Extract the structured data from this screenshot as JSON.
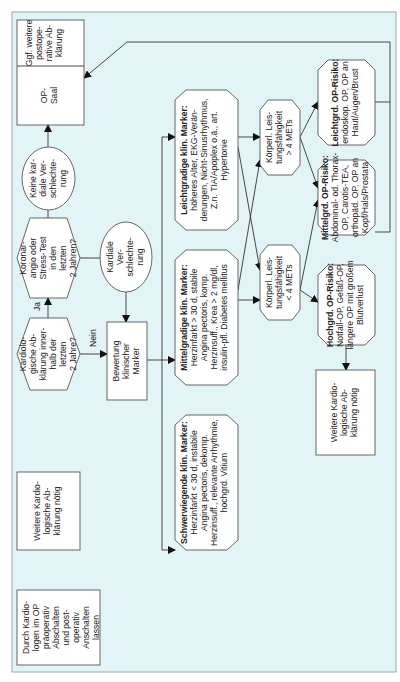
{
  "diagram": {
    "orientation": "rotated-90-ccw",
    "colors": {
      "panel_bg": "#e3f4f7",
      "node_fill": "#ffffff",
      "stroke": "#555555"
    },
    "nodes": {
      "durch_kardiologen": {
        "shape": "rect",
        "lines": [
          "Durch Kardio-",
          "logen im OP",
          "präoperativ",
          "Abschalten",
          "und post-",
          "operativ",
          "Anschalten",
          "lassen"
        ]
      },
      "weitere_links": {
        "shape": "rect",
        "lines": [
          "Weitere Kardio-",
          "logische Ab-",
          "klärung nötig"
        ]
      },
      "kardiologische_abklaerung": {
        "shape": "hexagon",
        "lines": [
          "Kardiolo-",
          "gische Ab-",
          "klärung inner-",
          "halb der",
          "letzten",
          "2 Jahre?"
        ]
      },
      "koronarangio": {
        "shape": "hexagon",
        "lines": [
          "Koronar-",
          "angio oder",
          "Stress-Test",
          "in den",
          "letzten",
          "2 Jahren?"
        ]
      },
      "keine_kardiale": {
        "shape": "ellipse",
        "lines": [
          "Keine kar-",
          "diale Ver-",
          "schlechte-",
          "rung"
        ]
      },
      "kardiale_verschlechterung": {
        "shape": "ellipse",
        "lines": [
          "Kardiale",
          "Ver-",
          "schlechte-",
          "rung"
        ]
      },
      "op_saal": {
        "shape": "rect",
        "lines": [
          "OP-",
          "Saal"
        ]
      },
      "ggf_weitere": {
        "shape": "rect",
        "lines": [
          "Ggf. weitere",
          "postope-",
          "rative Ab-",
          "klärung"
        ]
      },
      "bewertung": {
        "shape": "rect",
        "lines": [
          "Bewertung",
          "klinischer",
          "Marker"
        ]
      },
      "leichtgradige": {
        "shape": "hexagon",
        "title": "Leichtgradige klin. Marker:",
        "lines": [
          "höheres Alter, EKG-Verän-",
          "derungen, Nicht-Sinusrhythmus,",
          "Z.n. TIA/Apoplex o.ä., art.",
          "Hypertonie"
        ]
      },
      "mittelgradige": {
        "shape": "hexagon",
        "title": "Mittelgradige klin. Marker:",
        "lines": [
          "Herzinfarkt > 30 d, stabile",
          "Angina pectoris, komp.",
          "Herzinsuff., Krea > 2 mg/dl,",
          "insulin-pfl. Diabetes mellitus"
        ]
      },
      "schwerwiegende": {
        "shape": "hexagon",
        "title": "Schwerwiegende klin. Marker:",
        "lines": [
          "Herzinfarkt < 30 d, instabile",
          "Angina pectoris, dekomp.",
          "Herzinsuff., relevante Arrhythmie,",
          "hochgrd. Vitium"
        ]
      },
      "leistung_gt4": {
        "shape": "hexagon",
        "lines": [
          "Körperl. Leis-",
          "tungsfähigkeit",
          "> 4 METs"
        ]
      },
      "leistung_lt4": {
        "shape": "hexagon",
        "lines": [
          "Körperl. Leis-",
          "tungsfähigkeit",
          "< 4 METs"
        ]
      },
      "leichtgrd_op": {
        "shape": "hexagon",
        "title": "Leichtgrd. OP-Risiko:",
        "lines": [
          "endoskop. OP, OP an",
          "Haut/Augen/Brust"
        ]
      },
      "mittelgrd_op": {
        "shape": "hexagon",
        "title": "Mittelgrd. OP-Risiko:",
        "lines": [
          "Abdominal- od. Thorax-",
          "OP, Carotis-TEA,",
          "orthopäd. OP, OP an",
          "Kopf/Hals/Prostata"
        ]
      },
      "hochgrd_op": {
        "shape": "hexagon",
        "title": "Hochgrd. OP-Risiko:",
        "lines": [
          "Notfall-OP, Gefäß-OP,",
          "längere OP mit großem",
          "Blutverlust"
        ]
      },
      "weitere_rechts": {
        "shape": "rect",
        "lines": [
          "Weitere Kardio-",
          "logische Ab-",
          "klärung nötig"
        ]
      }
    },
    "edge_labels": {
      "ja": "Ja",
      "nein": "Nein"
    },
    "edges": [
      [
        "kardiologische_abklaerung",
        "koronarangio",
        "Ja"
      ],
      [
        "kardiologische_abklaerung",
        "bewertung",
        "Nein"
      ],
      [
        "koronarangio",
        "keine_kardiale",
        ""
      ],
      [
        "koronarangio",
        "kardiale_verschlechterung",
        ""
      ],
      [
        "keine_kardiale",
        "op_saal",
        ""
      ],
      [
        "kardiale_verschlechterung",
        "bewertung",
        ""
      ],
      [
        "bewertung",
        "leichtgradige",
        ""
      ],
      [
        "bewertung",
        "mittelgradige",
        ""
      ],
      [
        "bewertung",
        "schwerwiegende",
        ""
      ],
      [
        "leichtgradige",
        "leistung_gt4",
        ""
      ],
      [
        "leichtgradige",
        "leistung_lt4",
        ""
      ],
      [
        "mittelgradige",
        "leistung_gt4",
        ""
      ],
      [
        "mittelgradige",
        "leistung_lt4",
        ""
      ],
      [
        "leistung_gt4",
        "leichtgrd_op",
        ""
      ],
      [
        "leistung_gt4",
        "mittelgrd_op",
        ""
      ],
      [
        "leistung_lt4",
        "mittelgrd_op",
        ""
      ],
      [
        "leistung_lt4",
        "hochgrd_op",
        ""
      ],
      [
        "hochgrd_op",
        "weitere_rechts",
        ""
      ],
      [
        "leichtgrd_op",
        "op_saal",
        ""
      ],
      [
        "mittelgrd_op",
        "op_saal",
        ""
      ]
    ]
  }
}
